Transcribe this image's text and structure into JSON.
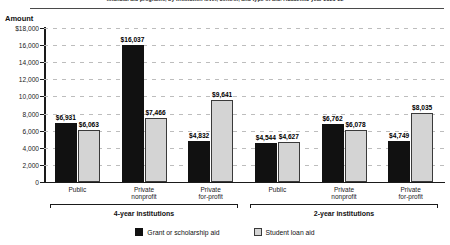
{
  "header": {
    "title": "financial aid programs, by institution level, control, and type of aid: Academic year 2021-22",
    "amount_axis_title": "Amount"
  },
  "legend": {
    "position": "bottom-center",
    "items": [
      {
        "label": "Grant or scholarship aid",
        "color": "#111111",
        "key": "grant"
      },
      {
        "label": "Student loan aid",
        "color": "#d4d4d4",
        "key": "loan"
      }
    ]
  },
  "brackets": [
    {
      "label": "4-year institutions"
    },
    {
      "label": "2-year institutions"
    }
  ],
  "chart_data": {
    "type": "bar",
    "title": "financial aid programs, by institution level, control, and type of aid: Academic year 2021-22",
    "xlabel": "",
    "ylabel": "Amount",
    "ylim": [
      0,
      18000
    ],
    "ytick_labels": [
      "$18,000",
      "16,000",
      "14,000",
      "12,000",
      "10,000",
      "8,000",
      "6,000",
      "4,000",
      "2,000",
      "0"
    ],
    "ytick_values": [
      18000,
      16000,
      14000,
      12000,
      10000,
      8000,
      6000,
      4000,
      2000,
      0
    ],
    "grid": true,
    "categories": [
      "Public",
      "Private\nnonprofit",
      "Private\nfor-profit",
      "Public",
      "Private\nnonprofit",
      "Private\nfor-profit"
    ],
    "groups": [
      {
        "name": "4-year institutions",
        "categories": [
          "Public",
          "Private nonprofit",
          "Private for-profit"
        ]
      },
      {
        "name": "2-year institutions",
        "categories": [
          "Public",
          "Private nonprofit",
          "Private for-profit"
        ]
      }
    ],
    "series": [
      {
        "name": "Grant or scholarship aid",
        "color": "#111111",
        "values": [
          6931,
          16037,
          4832,
          4544,
          6762,
          4749
        ],
        "labels": [
          "$6,931",
          "$16,037",
          "$4,832",
          "$4,544",
          "$6,762",
          "$4,749"
        ]
      },
      {
        "name": "Student loan aid",
        "color": "#d4d4d4",
        "values": [
          6063,
          7466,
          9641,
          4627,
          6078,
          8035
        ],
        "labels": [
          "$6,063",
          "$7,466",
          "$9,641",
          "$4,627",
          "$6,078",
          "$8,035"
        ]
      }
    ]
  }
}
